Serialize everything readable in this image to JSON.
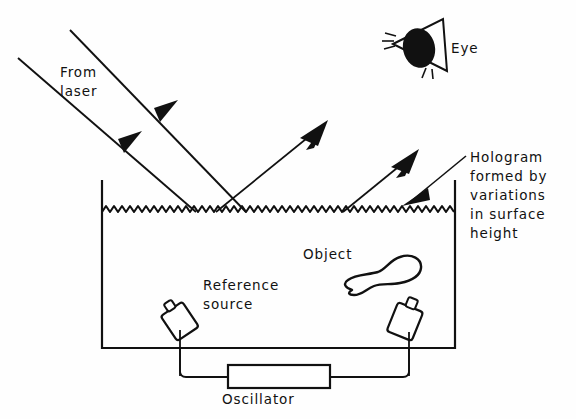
{
  "figure": {
    "domain": "diagram",
    "background_color": "#fefefe",
    "ink_color": "#111111",
    "labels": {
      "from_laser": "From\nlaser",
      "eye": "Eye",
      "hologram": "Hologram\nformed by\nvariations\nin surface\nheight",
      "object": "Object",
      "reference_source": "Reference\nsource",
      "oscillator": "Oscillator"
    },
    "components": [
      {
        "name": "tank",
        "description": "open rectangular liquid tank"
      },
      {
        "name": "liquid-surface",
        "description": "wavy liquid surface carrying the hologram"
      },
      {
        "name": "object",
        "description": "irregular submerged object outline"
      },
      {
        "name": "reference-transducer",
        "description": "tilted reference source transducer"
      },
      {
        "name": "object-transducer",
        "description": "tilted object illumination transducer"
      },
      {
        "name": "oscillator",
        "description": "rectangular oscillator driving both transducers"
      },
      {
        "name": "eye",
        "description": "observer eye symbol"
      }
    ],
    "rays": [
      {
        "name": "incoming-laser-upper",
        "direction": "down-right",
        "label": "From laser"
      },
      {
        "name": "incoming-laser-lower",
        "direction": "down-right",
        "label": "From laser"
      },
      {
        "name": "reflected-ray-left",
        "direction": "up-right",
        "label": ""
      },
      {
        "name": "reflected-ray-right",
        "direction": "up-right",
        "label": ""
      },
      {
        "name": "hologram-pointer",
        "direction": "down-left",
        "label": "Hologram formed by variations in surface height"
      }
    ]
  }
}
